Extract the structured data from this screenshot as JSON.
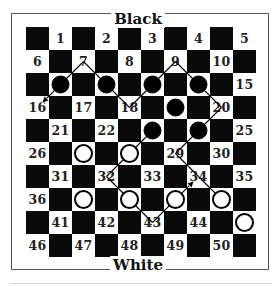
{
  "labels": {
    "top": "Black",
    "bottom": "White"
  },
  "board": {
    "size": 10,
    "cell_px": 23,
    "squares": [
      1,
      2,
      3,
      4,
      5,
      6,
      7,
      8,
      9,
      10,
      11,
      12,
      13,
      14,
      15,
      16,
      17,
      18,
      19,
      20,
      21,
      22,
      23,
      24,
      25,
      26,
      27,
      28,
      29,
      30,
      31,
      32,
      33,
      34,
      35,
      36,
      37,
      38,
      39,
      40,
      41,
      42,
      43,
      44,
      45,
      46,
      47,
      48,
      49,
      50
    ],
    "hidden_numbers": [
      11,
      12,
      13,
      14,
      19,
      23,
      24,
      27,
      28,
      37,
      38,
      39,
      40,
      45
    ],
    "colors": {
      "light": "#ffffff",
      "dark": "#0a0a0a",
      "number": "#222222"
    }
  },
  "pieces": {
    "black": [
      11,
      12,
      13,
      14,
      19,
      23,
      24
    ],
    "white": [
      27,
      28,
      37,
      38,
      39,
      40,
      45
    ]
  },
  "move_lines": [
    {
      "from": 7,
      "to": 16,
      "arrow": true
    },
    {
      "from": 7,
      "to": 18,
      "arrow": false
    },
    {
      "from": 18,
      "to": 9,
      "arrow": false
    },
    {
      "from": 9,
      "to": 20,
      "arrow": false
    },
    {
      "from": 20,
      "to": 29,
      "arrow": false
    },
    {
      "from": 29,
      "to": 34,
      "arrow": false
    },
    {
      "from": 34,
      "to": 40,
      "arrow": false
    },
    {
      "from": 23,
      "to": 32,
      "arrow": false
    },
    {
      "from": 32,
      "to": 43,
      "arrow": false
    },
    {
      "from": 43,
      "to": 34,
      "arrow": true
    }
  ]
}
